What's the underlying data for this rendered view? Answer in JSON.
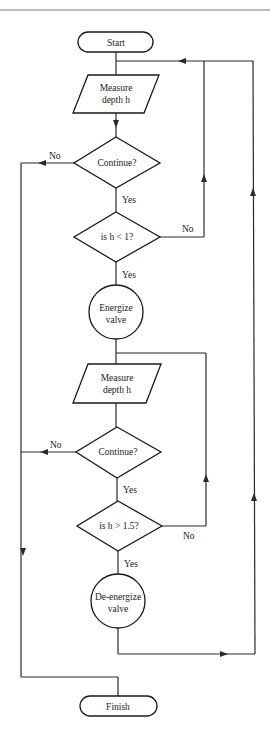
{
  "flowchart": {
    "colors": {
      "stroke": "#1a1a1a",
      "background": "#ffffff",
      "rule": "#7a7a7a"
    },
    "nodes": {
      "start": {
        "type": "terminator",
        "label": "Start"
      },
      "measure1": {
        "type": "input",
        "line1": "Measure",
        "line2": "depth h"
      },
      "continue1": {
        "type": "decision",
        "label": "Continue?"
      },
      "check_low": {
        "type": "decision",
        "label": "is h < 1?"
      },
      "energize": {
        "type": "process-circle",
        "line1": "Energize",
        "line2": "valve"
      },
      "measure2": {
        "type": "input",
        "line1": "Measure",
        "line2": "depth h"
      },
      "continue2": {
        "type": "decision",
        "label": "Continue?"
      },
      "check_high": {
        "type": "decision",
        "label": "is h > 1.5?"
      },
      "deenergize": {
        "type": "process-circle",
        "line1": "De-energize",
        "line2": "valve"
      },
      "finish": {
        "type": "terminator",
        "label": "Finish"
      }
    },
    "edge_labels": {
      "continue1_no": "No",
      "continue1_yes": "Yes",
      "check_low_no": "No",
      "check_low_yes": "Yes",
      "continue2_no": "No",
      "continue2_yes": "Yes",
      "check_high_no": "No",
      "check_high_yes": "Yes"
    }
  }
}
